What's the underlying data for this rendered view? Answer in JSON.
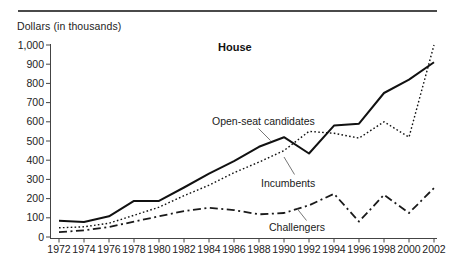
{
  "chart_data": {
    "type": "line",
    "title": "House",
    "ylabel": "Dollars (in thousands)",
    "xlabel": "",
    "x": [
      1972,
      1974,
      1976,
      1978,
      1980,
      1982,
      1984,
      1986,
      1988,
      1990,
      1992,
      1994,
      1996,
      1998,
      2000,
      2002
    ],
    "x_tick_labels": [
      "1972",
      "1974",
      "1976",
      "1978",
      "1980",
      "1982",
      "1984",
      "1986",
      "1988",
      "1990",
      "1992",
      "1994",
      "1996",
      "1998",
      "2000",
      "2002"
    ],
    "y_ticks": [
      0,
      100,
      200,
      300,
      400,
      500,
      600,
      700,
      800,
      900,
      1000
    ],
    "y_tick_labels": [
      "0",
      "100",
      "200",
      "300",
      "400",
      "500",
      "600",
      "700",
      "800",
      "900",
      "1,000"
    ],
    "ylim": [
      0,
      1000
    ],
    "grid": false,
    "legend_position": "inline-annotations",
    "series": [
      {
        "name": "Open-seat candidates",
        "line_style": "solid",
        "color": "#111111",
        "values": [
          85,
          78,
          108,
          188,
          188,
          258,
          330,
          395,
          470,
          520,
          435,
          580,
          590,
          750,
          820,
          910
        ]
      },
      {
        "name": "Incumbents",
        "line_style": "dotted",
        "color": "#111111",
        "values": [
          48,
          53,
          72,
          113,
          155,
          215,
          270,
          335,
          390,
          450,
          550,
          540,
          515,
          600,
          520,
          1000
        ]
      },
      {
        "name": "Challengers",
        "line_style": "dash-dot",
        "color": "#1a1a1a",
        "values": [
          25,
          35,
          52,
          80,
          108,
          135,
          152,
          140,
          118,
          125,
          165,
          225,
          80,
          220,
          125,
          255
        ]
      }
    ],
    "axis_color": "#444444",
    "text_color": "#222222"
  }
}
